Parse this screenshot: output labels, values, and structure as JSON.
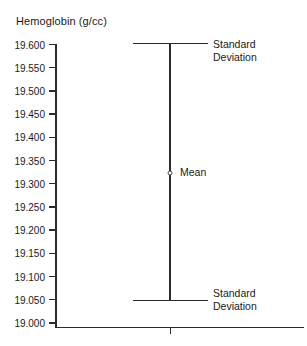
{
  "chart_data": {
    "type": "errorbar",
    "title": "Hemoglobin (g/cc)",
    "xlabel": "",
    "ylabel": "Hemoglobin (g/cc)",
    "ylim": [
      19.0,
      19.6
    ],
    "grid": false,
    "legend": "none",
    "y_ticks": [
      "19.600",
      "19.550",
      "19.500",
      "19.450",
      "19.400",
      "19.350",
      "19.300",
      "19.250",
      "19.200",
      "19.150",
      "19.100",
      "19.050",
      "19.000"
    ],
    "y_tick_values": [
      19.6,
      19.55,
      19.5,
      19.45,
      19.4,
      19.35,
      19.3,
      19.25,
      19.2,
      19.15,
      19.1,
      19.05,
      19.0
    ],
    "series": [
      {
        "name": "Hemoglobin",
        "mean": 19.322,
        "upper": 19.602,
        "lower": 19.048,
        "x_position": 0.5
      }
    ],
    "annotations": [
      {
        "id": "upper-sd",
        "text_line1": "Standard",
        "text_line2": "Deviation",
        "value": 19.602
      },
      {
        "id": "mean",
        "text_line1": "Mean",
        "text_line2": "",
        "value": 19.322
      },
      {
        "id": "lower-sd",
        "text_line1": "Standard",
        "text_line2": "Deviation",
        "value": 19.048
      }
    ]
  },
  "labels": {
    "title": "Hemoglobin (g/cc)",
    "mean": "Mean",
    "standard": "Standard",
    "deviation": "Deviation"
  },
  "colors": {
    "background": "#ffffff",
    "axis": "#2b2b2b",
    "text": "#1a1a1a",
    "marker_stroke": "#4a4a4a"
  }
}
